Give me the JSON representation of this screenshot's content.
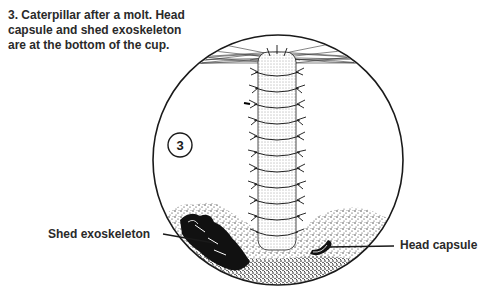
{
  "figure": {
    "caption_lines": [
      "3. Caterpillar after a molt. Head",
      "capsule and shed exoskeleton",
      "are at the bottom of the cup."
    ],
    "step_number": "3",
    "labels": {
      "shed_exoskeleton": "Shed exoskeleton",
      "head_capsule": "Head capsule"
    },
    "colors": {
      "ink": "#1a1a1a",
      "text": "#2a2a2a",
      "background": "#ffffff"
    }
  }
}
